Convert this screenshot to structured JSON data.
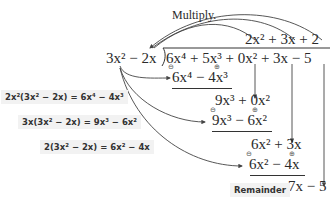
{
  "label_multiply": "Multiply.",
  "quotient": "2x² + 3x + 2",
  "divisor": "3x² − 2x",
  "dividend": "6x⁴ + 5x³ + 0x² + 3x − 5",
  "steps": [
    {
      "product": "6x⁴ − 4x³",
      "note": "2x²(3x² − 2x) = 6x⁴ − 4x³"
    },
    {
      "bring_down": "9x³ + 0x²",
      "product": "9x³ − 6x²",
      "note": "3x(3x² − 2x) = 9x³ − 6x²"
    },
    {
      "bring_down": "6x² + 3x",
      "product": "6x² − 4x",
      "note": "2(3x² − 2x) = 6x² − 4x"
    }
  ],
  "remainder": "7x − 5",
  "label_remainder": "Remainder",
  "sign_minus": "⊖",
  "sign_plus": "⊕"
}
